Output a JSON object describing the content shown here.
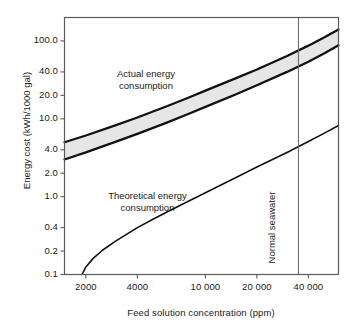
{
  "chart_data": {
    "type": "line",
    "title": "",
    "xlabel": "Feed solution concentration (ppm)",
    "ylabel": "Energy cost (kWh/1000 gal)",
    "xscale": "log",
    "yscale": "log",
    "xlim": [
      1500,
      60000
    ],
    "ylim": [
      0.1,
      200
    ],
    "grid": false,
    "legend": "none",
    "xticks": [
      {
        "value": 2000,
        "label": "2000"
      },
      {
        "value": 4000,
        "label": "4000"
      },
      {
        "value": 10000,
        "label": "10 000"
      },
      {
        "value": 20000,
        "label": "20 000"
      },
      {
        "value": 40000,
        "label": "40 000"
      }
    ],
    "yticks": [
      {
        "value": 100,
        "label": "100.0"
      },
      {
        "value": 40,
        "label": "40.0"
      },
      {
        "value": 20,
        "label": "20.0"
      },
      {
        "value": 10,
        "label": "10.0"
      },
      {
        "value": 4,
        "label": "4.0"
      },
      {
        "value": 2,
        "label": "2.0"
      },
      {
        "value": 1,
        "label": "1.0"
      },
      {
        "value": 0.4,
        "label": "0.4"
      },
      {
        "value": 0.2,
        "label": "0.2"
      },
      {
        "value": 0.1,
        "label": "0.1"
      }
    ],
    "series": [
      {
        "name": "Actual energy consumption (upper bound)",
        "style": "solid-thick",
        "points": [
          [
            1500,
            5.0
          ],
          [
            2000,
            6.1
          ],
          [
            3000,
            8.3
          ],
          [
            4000,
            10.4
          ],
          [
            6000,
            14.6
          ],
          [
            8000,
            18.8
          ],
          [
            10000,
            23.0
          ],
          [
            15000,
            33.0
          ],
          [
            20000,
            43.0
          ],
          [
            30000,
            64.0
          ],
          [
            40000,
            87.0
          ],
          [
            50000,
            112.0
          ],
          [
            60000,
            140.0
          ]
        ]
      },
      {
        "name": "Actual energy consumption (lower bound)",
        "style": "solid-thick",
        "points": [
          [
            1500,
            3.0
          ],
          [
            2000,
            3.7
          ],
          [
            3000,
            5.1
          ],
          [
            4000,
            6.4
          ],
          [
            6000,
            9.0
          ],
          [
            8000,
            11.6
          ],
          [
            10000,
            14.2
          ],
          [
            15000,
            20.5
          ],
          [
            20000,
            27.0
          ],
          [
            30000,
            40.0
          ],
          [
            40000,
            54.0
          ],
          [
            50000,
            70.0
          ],
          [
            60000,
            88.0
          ]
        ]
      },
      {
        "name": "Theoretical energy consumption",
        "style": "solid-thin",
        "points": [
          [
            1900,
            0.1
          ],
          [
            2000,
            0.125
          ],
          [
            2200,
            0.16
          ],
          [
            2500,
            0.205
          ],
          [
            3000,
            0.27
          ],
          [
            4000,
            0.4
          ],
          [
            5000,
            0.52
          ],
          [
            6000,
            0.64
          ],
          [
            8000,
            0.88
          ],
          [
            10000,
            1.12
          ],
          [
            15000,
            1.75
          ],
          [
            20000,
            2.4
          ],
          [
            30000,
            3.7
          ],
          [
            40000,
            5.1
          ],
          [
            50000,
            6.6
          ],
          [
            60000,
            8.2
          ]
        ]
      }
    ],
    "band": {
      "name": "Actual energy consumption band",
      "fill": "#e6e6e6",
      "between": [
        "Actual energy consumption (upper bound)",
        "Actual energy consumption (lower bound)"
      ]
    },
    "markers": [
      {
        "name": "Normal seawater",
        "type": "vline",
        "value": 35000,
        "label": "Normal seawater"
      }
    ],
    "annotations": [
      {
        "name": "actual-energy-label",
        "text_line1": "Actual energy",
        "text_line2": "consumption"
      },
      {
        "name": "theoretical-energy-label",
        "text_line1": "Theoretical energy",
        "text_line2": "consumption"
      }
    ],
    "colors": {
      "line": "#111111",
      "band_fill": "#e6e6e6",
      "axis": "#4d4d4d",
      "vline": "#555555",
      "text": "#1a1a1a",
      "background": "#ffffff"
    }
  }
}
